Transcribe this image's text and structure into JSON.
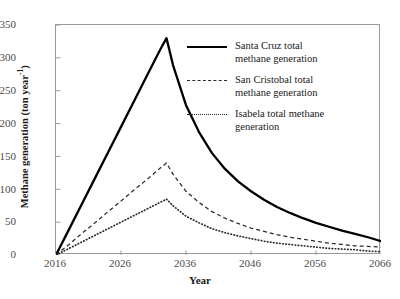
{
  "chart_data": {
    "type": "line",
    "title": "",
    "xlabel": "Year",
    "ylabel": "Methane generation (ton year−1)",
    "ylabel_main": "Methane generation (ton year",
    "ylabel_sup": "-1",
    "ylabel_tail": ")",
    "xlim": [
      2016,
      2066
    ],
    "ylim": [
      0,
      350
    ],
    "xticks": [
      2016,
      2026,
      2036,
      2046,
      2056,
      2066
    ],
    "yticks": [
      0,
      50,
      100,
      150,
      200,
      250,
      300,
      350
    ],
    "grid": false,
    "legend_position": "upper-right-inside",
    "x": [
      2016,
      2018,
      2020,
      2022,
      2024,
      2026,
      2028,
      2030,
      2032,
      2033,
      2034,
      2036,
      2038,
      2040,
      2042,
      2044,
      2046,
      2048,
      2050,
      2052,
      2054,
      2056,
      2058,
      2060,
      2062,
      2064,
      2066
    ],
    "series": [
      {
        "name": "Santa Cruz total methane generation",
        "style": "solid",
        "color": "#000000",
        "peak_year": 2033,
        "peak_value": 330,
        "values": [
          0,
          39,
          78,
          117,
          156,
          195,
          234,
          273,
          312,
          330,
          289,
          228,
          187,
          155,
          131,
          112,
          97,
          84,
          73,
          64,
          56,
          49,
          43,
          37,
          32,
          27,
          21
        ]
      },
      {
        "name": "San Cristobal total methane generation",
        "style": "dashed",
        "color": "#2a2a2a",
        "peak_year": 2033,
        "peak_value": 140,
        "values": [
          0,
          16,
          33,
          49,
          66,
          82,
          99,
          115,
          132,
          140,
          123,
          97,
          80,
          66,
          56,
          48,
          41,
          36,
          31,
          27,
          24,
          21,
          18,
          16,
          14,
          13,
          12
        ]
      },
      {
        "name": "Isabela total methane generation",
        "style": "dotted",
        "color": "#2a2a2a",
        "peak_year": 2033,
        "peak_value": 85,
        "values": [
          0,
          10,
          20,
          30,
          40,
          50,
          60,
          70,
          80,
          85,
          75,
          59,
          49,
          40,
          34,
          29,
          25,
          21,
          18,
          16,
          14,
          12,
          10,
          9,
          8,
          6,
          5
        ]
      }
    ],
    "legend": [
      {
        "label_line1": "Santa Cruz total",
        "label_line2": "methane generation",
        "style": "solid"
      },
      {
        "label_line1": "San Cristobal total",
        "label_line2": "methane generation",
        "style": "dashed"
      },
      {
        "label_line1": "Isabela total methane",
        "label_line2": "generation",
        "style": "dotted"
      }
    ]
  }
}
